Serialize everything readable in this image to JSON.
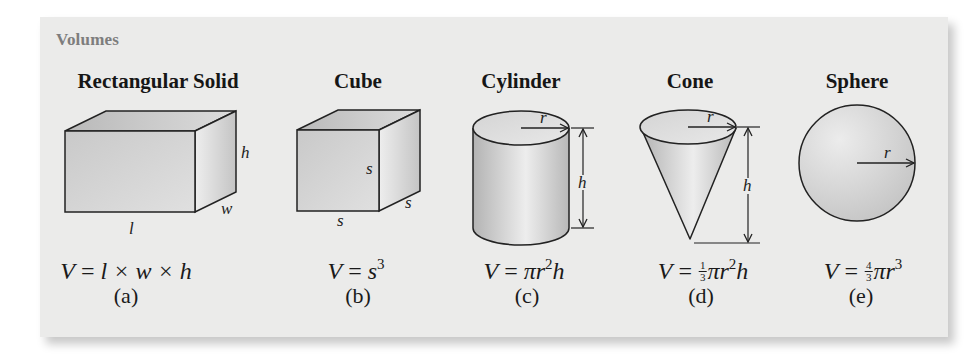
{
  "section_title": "Volumes",
  "colors": {
    "panel_bg": "#ebebea",
    "section_title": "#7d7d7d",
    "stroke": "#222222"
  },
  "shapes": [
    {
      "id": "a",
      "name": "Rectangular Solid",
      "dimension_labels": [
        "h",
        "w",
        "l"
      ],
      "formula": {
        "lhs": "V",
        "rhs": "l × w × h"
      },
      "label": "(a)"
    },
    {
      "id": "b",
      "name": "Cube",
      "dimension_labels": [
        "s",
        "s",
        "s"
      ],
      "formula": {
        "lhs": "V",
        "base": "s",
        "exp": "3"
      },
      "label": "(b)"
    },
    {
      "id": "c",
      "name": "Cylinder",
      "dimension_labels": [
        "r",
        "h"
      ],
      "formula": {
        "lhs": "V",
        "pi": "π",
        "var": "r",
        "exp": "2",
        "tail": "h"
      },
      "label": "(c)"
    },
    {
      "id": "d",
      "name": "Cone",
      "dimension_labels": [
        "r",
        "h"
      ],
      "formula": {
        "lhs": "V",
        "num": "1",
        "den": "3",
        "pi": "π",
        "var": "r",
        "exp": "2",
        "tail": "h"
      },
      "label": "(d)"
    },
    {
      "id": "e",
      "name": "Sphere",
      "dimension_labels": [
        "r"
      ],
      "formula": {
        "lhs": "V",
        "num": "4",
        "den": "3",
        "pi": "π",
        "var": "r",
        "exp": "3"
      },
      "label": "(e)"
    }
  ],
  "eq": "="
}
